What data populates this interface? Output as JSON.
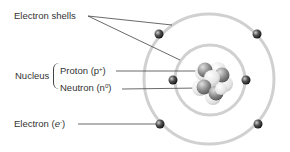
{
  "diagram": {
    "labels": {
      "electron_shells": "Electron shells",
      "nucleus": "Nucleus",
      "proton": "Proton (p",
      "proton_sup": "+",
      "proton_close": ")",
      "neutron": "Neutron (n",
      "neutron_sup": "0",
      "neutron_close": ")",
      "electron": "Electron (",
      "electron_symbol": "e",
      "electron_sup": "-",
      "electron_close": ")"
    },
    "shells": [
      {
        "name": "inner-shell",
        "cx": 210,
        "cy": 80,
        "r": 35
      },
      {
        "name": "outer-shell",
        "cx": 209,
        "cy": 79,
        "r": 65
      }
    ],
    "electrons": [
      {
        "x": 159,
        "y": 34
      },
      {
        "x": 257,
        "y": 34
      },
      {
        "x": 173,
        "y": 80
      },
      {
        "x": 246,
        "y": 80
      },
      {
        "x": 160,
        "y": 124
      },
      {
        "x": 258,
        "y": 124
      }
    ],
    "colors": {
      "shell": "#cfcfcf",
      "line": "#444444",
      "electron": "#333333",
      "nucleus_light": "#e8e8e8",
      "nucleus_dark": "#7a7a7a"
    }
  }
}
